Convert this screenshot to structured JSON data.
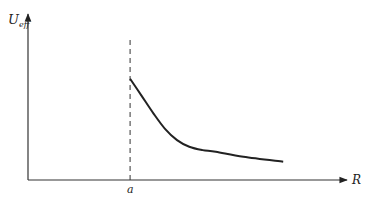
{
  "chart_data": {
    "type": "line",
    "title": "",
    "xlabel": "R",
    "ylabel": "U",
    "ylabel_subscript": "eff",
    "marker_label": "a",
    "marker": {
      "x": 1.0,
      "style": "dashed"
    },
    "xlim": [
      0,
      3.0
    ],
    "ylim": [
      0,
      1.0
    ],
    "grid": false,
    "legend": "none",
    "series": [
      {
        "name": "U_eff(R)",
        "x": [
          1.0,
          1.11,
          1.23,
          1.34,
          1.46,
          1.58,
          1.71,
          1.84,
          2.11,
          2.5
        ],
        "y": [
          0.61,
          0.51,
          0.4,
          0.31,
          0.24,
          0.2,
          0.18,
          0.17,
          0.14,
          0.11
        ]
      }
    ]
  }
}
